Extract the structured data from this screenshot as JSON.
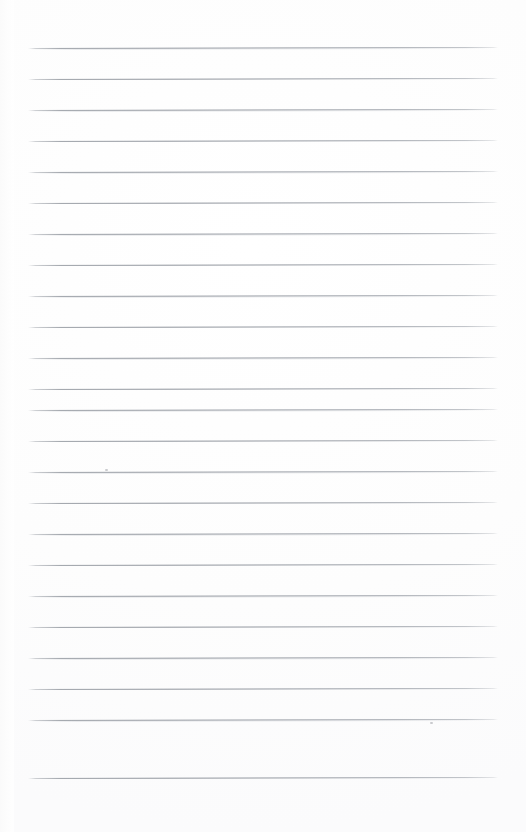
{
  "document": {
    "kind": "lined-notebook-page",
    "title": "Blank ruled notebook page",
    "background_color": "#fefefe",
    "width": 526,
    "height": 832,
    "text_content": "",
    "has_text": false
  },
  "ruling": {
    "line_color": "#8f949c",
    "line_thickness_px": 1,
    "line_count": 24,
    "first_line_y": 48,
    "last_line_y": 778,
    "line_spacing_px": 31.3,
    "left_margin_x": 28,
    "right_margin_x": 498,
    "line_length_px": 470,
    "skew_deg": -0.12,
    "bottom_blank_space_px": 54,
    "top_blank_space_px": 48
  },
  "lines": [
    {
      "index": 1,
      "y": 48,
      "x_start": 28,
      "x_end": 498
    },
    {
      "index": 2,
      "y": 79,
      "x_start": 28,
      "x_end": 498
    },
    {
      "index": 3,
      "y": 110,
      "x_start": 28,
      "x_end": 498
    },
    {
      "index": 4,
      "y": 141,
      "x_start": 28,
      "x_end": 498
    },
    {
      "index": 5,
      "y": 172,
      "x_start": 28,
      "x_end": 498
    },
    {
      "index": 6,
      "y": 203,
      "x_start": 28,
      "x_end": 498
    },
    {
      "index": 7,
      "y": 234,
      "x_start": 28,
      "x_end": 498
    },
    {
      "index": 8,
      "y": 265,
      "x_start": 28,
      "x_end": 498
    },
    {
      "index": 9,
      "y": 296,
      "x_start": 28,
      "x_end": 498
    },
    {
      "index": 10,
      "y": 327,
      "x_start": 28,
      "x_end": 498
    },
    {
      "index": 11,
      "y": 358,
      "x_start": 28,
      "x_end": 498
    },
    {
      "index": 12,
      "y": 389,
      "x_start": 28,
      "x_end": 498
    },
    {
      "index": 13,
      "y": 410,
      "x_start": 28,
      "x_end": 498
    },
    {
      "index": 14,
      "y": 441,
      "x_start": 28,
      "x_end": 498
    },
    {
      "index": 15,
      "y": 472,
      "x_start": 28,
      "x_end": 498
    },
    {
      "index": 16,
      "y": 503,
      "x_start": 28,
      "x_end": 498
    },
    {
      "index": 17,
      "y": 534,
      "x_start": 28,
      "x_end": 498
    },
    {
      "index": 18,
      "y": 565,
      "x_start": 28,
      "x_end": 498
    },
    {
      "index": 19,
      "y": 596,
      "x_start": 28,
      "x_end": 498
    },
    {
      "index": 20,
      "y": 627,
      "x_start": 28,
      "x_end": 498
    },
    {
      "index": 21,
      "y": 658,
      "x_start": 28,
      "x_end": 498
    },
    {
      "index": 22,
      "y": 689,
      "x_start": 28,
      "x_end": 498
    },
    {
      "index": 23,
      "y": 720,
      "x_start": 28,
      "x_end": 498
    },
    {
      "index": 24,
      "y": 778,
      "x_start": 28,
      "x_end": 498
    }
  ],
  "artifacts": [
    {
      "name": "scan-speck-left",
      "x": 105,
      "y": 469,
      "w": 3,
      "h": 2
    },
    {
      "name": "scan-speck-right",
      "x": 430,
      "y": 722,
      "w": 3,
      "h": 2
    }
  ]
}
